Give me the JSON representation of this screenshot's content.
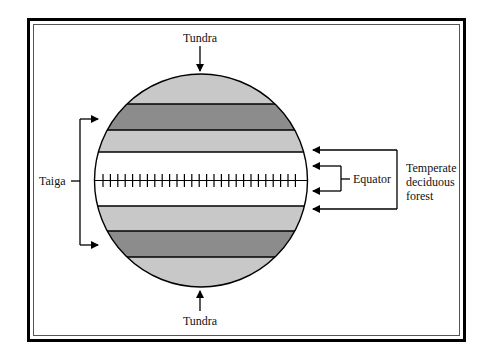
{
  "diagram": {
    "type": "planet-biome-bands",
    "labels": {
      "top": "Tundra",
      "bottom": "Tundra",
      "left": "Taiga",
      "equator": "Equator",
      "right_lines": [
        "Temperate",
        "deciduous",
        "forest"
      ]
    },
    "bands": [
      {
        "name": "Tundra",
        "position": "north-cap",
        "color": "#c8c8c8"
      },
      {
        "name": "Taiga",
        "position": "north",
        "color": "#8c8c8c"
      },
      {
        "name": "Temperate deciduous forest",
        "position": "north-mid",
        "color": "#c8c8c8"
      },
      {
        "name": "Equatorial zone",
        "position": "center",
        "color": "#ffffff"
      },
      {
        "name": "Temperate deciduous forest",
        "position": "south-mid",
        "color": "#c8c8c8"
      },
      {
        "name": "Taiga",
        "position": "south",
        "color": "#8c8c8c"
      },
      {
        "name": "Tundra",
        "position": "south-cap",
        "color": "#c8c8c8"
      }
    ],
    "colors": {
      "light_band": "#c8c8c8",
      "dark_band": "#8c8c8c",
      "outline": "#000000",
      "background": "#ffffff"
    }
  }
}
